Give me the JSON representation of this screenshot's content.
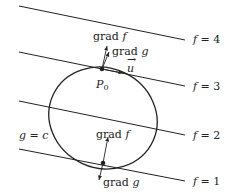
{
  "diagram": {
    "level_lines": [
      {
        "label": "f = 4",
        "x1": 19,
        "y1": 6,
        "x2": 185,
        "y2": 40,
        "label_x": 193,
        "label_y": 43
      },
      {
        "label": "f = 3",
        "x1": 19,
        "y1": 52,
        "x2": 185,
        "y2": 86,
        "label_x": 193,
        "label_y": 90
      },
      {
        "label": "f = 2",
        "x1": 19,
        "y1": 101,
        "x2": 185,
        "y2": 135,
        "label_x": 193,
        "label_y": 139
      },
      {
        "label": "f = 1",
        "x1": 19,
        "y1": 149,
        "x2": 185,
        "y2": 181,
        "label_x": 193,
        "label_y": 185
      }
    ],
    "constraint_curve": {
      "label": "g = c"
    },
    "points": {
      "p0": {
        "label": "P",
        "subscript": "0"
      }
    },
    "vectors": {
      "grad_f_top": "grad f",
      "grad_g_top": "grad g",
      "u": "u",
      "grad_f_bottom": "grad f",
      "grad_g_bottom": "grad g"
    },
    "colors": {
      "stroke": "#222222",
      "background": "#ffffff"
    }
  }
}
